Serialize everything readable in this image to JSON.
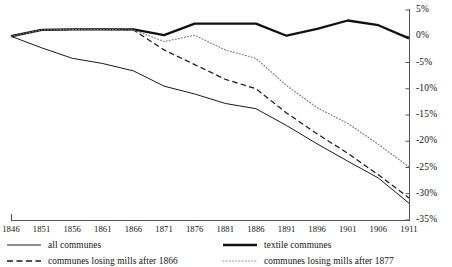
{
  "chart_data": {
    "type": "line",
    "title": "",
    "subtitle": "",
    "xlabel": "",
    "ylabel": "",
    "grid": false,
    "legend_position": "bottom",
    "x": [
      1846,
      1851,
      1856,
      1861,
      1866,
      1871,
      1876,
      1881,
      1886,
      1891,
      1896,
      1901,
      1906,
      1911
    ],
    "xtick_labels": [
      "1846",
      "1851",
      "1856",
      "1861",
      "1866",
      "1871",
      "1876",
      "1881",
      "1886",
      "1891",
      "1896",
      "1901",
      "1906",
      "1911"
    ],
    "xlim": [
      1846,
      1911
    ],
    "ylim": [
      -35,
      5
    ],
    "ytick_values": [
      5,
      0,
      -5,
      -10,
      -15,
      -20,
      -25,
      -30,
      -35
    ],
    "ytick_labels": [
      "5%",
      "0%",
      "-5%",
      "-10%",
      "-15%",
      "-20%",
      "-25%",
      "-30%",
      "-35%"
    ],
    "series": [
      {
        "name": "all communes",
        "style": "solid-thin",
        "color": "#1a1a1a",
        "values": [
          0.0,
          -2.2,
          -4.2,
          -5.2,
          -6.6,
          -9.5,
          -11.0,
          -12.8,
          -13.8,
          -17.0,
          -20.5,
          -23.8,
          -27.0,
          -31.8
        ]
      },
      {
        "name": "textile communes",
        "style": "solid-thick",
        "color": "#111111",
        "values": [
          0.0,
          1.2,
          1.3,
          1.3,
          1.3,
          0.2,
          2.4,
          2.4,
          2.4,
          0.1,
          1.4,
          3.0,
          2.1,
          -0.4
        ]
      },
      {
        "name": "communes losing mills after 1866",
        "style": "dashed",
        "color": "#1a1a1a",
        "values": [
          0.0,
          1.2,
          1.3,
          1.3,
          1.2,
          -2.6,
          -5.4,
          -8.2,
          -10.0,
          -14.6,
          -18.6,
          -22.3,
          -26.4,
          -30.8
        ]
      },
      {
        "name": "communes losing mills after 1877",
        "style": "dotted",
        "color": "#7a7a7a",
        "values": [
          0.0,
          1.2,
          1.3,
          1.3,
          1.2,
          -1.0,
          0.2,
          -2.6,
          -4.2,
          -9.4,
          -13.6,
          -16.6,
          -20.6,
          -24.9
        ]
      }
    ]
  },
  "axis": {
    "ytick_labels": [
      "5%",
      "0%",
      "-5%",
      "-10%",
      "-15%",
      "-20%",
      "-25%",
      "-30%",
      "-35%"
    ],
    "xtick_labels": [
      "1846",
      "1851",
      "1856",
      "1861",
      "1866",
      "1871",
      "1876",
      "1881",
      "1886",
      "1891",
      "1896",
      "1901",
      "1906",
      "1911"
    ]
  },
  "legend": {
    "items": [
      {
        "label": "all communes",
        "style": "solid-thin"
      },
      {
        "label": "textile communes",
        "style": "solid-thick"
      },
      {
        "label": "communes losing mills after 1866",
        "style": "dashed"
      },
      {
        "label": "communes losing mills after 1877",
        "style": "dotted"
      }
    ]
  }
}
